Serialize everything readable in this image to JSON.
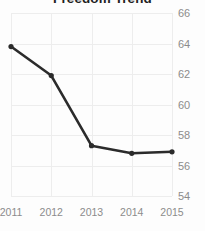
{
  "chart_data": {
    "type": "line",
    "title": "Freedom Trend",
    "xlabel": "",
    "ylabel": "",
    "categories": [
      "2011",
      "2012",
      "2013",
      "2014",
      "2015"
    ],
    "values": [
      63.8,
      61.9,
      57.3,
      56.8,
      56.9
    ],
    "series": [
      {
        "name": "Freedom Score",
        "values": [
          63.8,
          61.9,
          57.3,
          56.8,
          56.9
        ]
      }
    ],
    "x_tick_labels": [
      "2011",
      "2012",
      "2013",
      "2014",
      "2015"
    ],
    "y_tick_labels": [
      "66",
      "64",
      "62",
      "60",
      "58",
      "56",
      "54"
    ],
    "y_ticks": [
      66,
      64,
      62,
      60,
      58,
      56,
      54
    ],
    "ylim": [
      54,
      66
    ],
    "xlim": [
      2011,
      2015
    ],
    "grid": true,
    "grid_color": "#ededed",
    "legend": false,
    "legend_position": "none",
    "line_color": "#2b2b2b",
    "marker": "circle",
    "marker_color": "#2b2b2b",
    "background_color": "#fdfdfd",
    "title_color": "#1f1f1f",
    "tick_label_color": "#8c8c8c",
    "y_axis_side": "right",
    "annotations": []
  }
}
